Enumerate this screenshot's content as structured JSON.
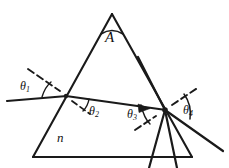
{
  "figure": {
    "kind": "optics-ray-diagram",
    "background_color": "#ffffff",
    "ink_color": "#1a1a1a"
  },
  "labels": {
    "apex_angle": {
      "symbol": "A",
      "subscript": ""
    },
    "refractive_index": {
      "symbol": "n",
      "subscript": ""
    },
    "theta1": {
      "symbol": "θ",
      "subscript": "1"
    },
    "theta2": {
      "symbol": "θ",
      "subscript": "2"
    },
    "theta3": {
      "symbol": "θ",
      "subscript": "3"
    },
    "theta4": {
      "symbol": "θ",
      "subscript": "4"
    }
  },
  "geometry": {
    "prism": {
      "apex": [
        112,
        14
      ],
      "bottom_left": [
        33,
        157
      ],
      "bottom_right": [
        192,
        157
      ]
    },
    "entry_point": [
      66,
      96
    ],
    "exit_point": [
      165,
      110
    ],
    "incident_ray": {
      "from": [
        7,
        101
      ],
      "to": [
        66,
        96
      ]
    },
    "internal_ray": {
      "from": [
        66,
        96
      ],
      "to": [
        165,
        110
      ],
      "arrow_at": [
        146,
        107
      ]
    },
    "exit_rays": [
      {
        "from": [
          165,
          110
        ],
        "to": [
          222,
          150
        ]
      },
      {
        "from": [
          165,
          110
        ],
        "to": [
          150,
          167
        ]
      },
      {
        "from": [
          165,
          110
        ],
        "to": [
          176,
          167
        ]
      }
    ],
    "normals_dashed": [
      {
        "from": [
          28,
          69
        ],
        "to": [
          78,
          104
        ]
      },
      {
        "from": [
          78,
          118
        ],
        "to": [
          66,
          96
        ]
      },
      {
        "from": [
          135,
          130
        ],
        "to": [
          165,
          110
        ]
      },
      {
        "from": [
          165,
          110
        ],
        "to": [
          199,
          87
        ]
      }
    ],
    "arc_markers": [
      {
        "name": "apex-angle-arc",
        "center": [
          112,
          14
        ],
        "radius": 20
      },
      {
        "name": "theta1-arc",
        "center": [
          66,
          96
        ],
        "radius": 24
      },
      {
        "name": "theta2-arc",
        "center": [
          66,
          96
        ],
        "radius": 26
      },
      {
        "name": "theta3-arc",
        "center": [
          165,
          110
        ],
        "radius": 24
      },
      {
        "name": "theta4-arc",
        "center": [
          165,
          110
        ],
        "radius": 26
      }
    ]
  }
}
